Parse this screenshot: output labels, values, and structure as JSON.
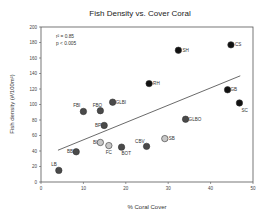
{
  "chart_data": {
    "type": "scatter",
    "title": "Fish Density vs. Cover Coral",
    "xlabel": "% Coral Cover",
    "ylabel": "Fish density (#/100m²)",
    "xlim": [
      0,
      50
    ],
    "ylim": [
      0,
      200
    ],
    "xticks": [
      0,
      10,
      20,
      30,
      40,
      50
    ],
    "yticks": [
      0,
      20,
      40,
      60,
      80,
      100,
      120,
      140,
      160,
      180,
      200
    ],
    "grid": false,
    "legend": null,
    "annotations": [
      "r² = 0.85",
      "p < 0.005"
    ],
    "points": [
      {
        "label": "CS",
        "x": 44.8,
        "y": 177,
        "shade": "black"
      },
      {
        "label": "SH",
        "x": 32.4,
        "y": 170,
        "shade": "black"
      },
      {
        "label": "RH",
        "x": 25.5,
        "y": 127,
        "shade": "black"
      },
      {
        "label": "GB",
        "x": 44.0,
        "y": 119,
        "shade": "black"
      },
      {
        "label": "SC",
        "x": 46.8,
        "y": 102,
        "shade": "black"
      },
      {
        "label": "GLBI",
        "x": 16.9,
        "y": 103,
        "shade": "darkgray"
      },
      {
        "label": "FBO",
        "x": 14.0,
        "y": 92,
        "shade": "darkgray"
      },
      {
        "label": "FBI",
        "x": 10.0,
        "y": 91,
        "shade": "darkgray"
      },
      {
        "label": "GLBO",
        "x": 34.1,
        "y": 81,
        "shade": "darkgray"
      },
      {
        "label": "BP",
        "x": 14.9,
        "y": 73,
        "shade": "darkgray"
      },
      {
        "label": "SB",
        "x": 29.2,
        "y": 56,
        "shade": "lightgray"
      },
      {
        "label": "BI",
        "x": 14.0,
        "y": 51,
        "shade": "lightgray"
      },
      {
        "label": "FC",
        "x": 16.0,
        "y": 47,
        "shade": "lightgray"
      },
      {
        "label": "CBV",
        "x": 24.9,
        "y": 46,
        "shade": "darkgray"
      },
      {
        "label": "BOT",
        "x": 19.0,
        "y": 45,
        "shade": "darkgray"
      },
      {
        "label": "BB",
        "x": 8.3,
        "y": 39,
        "shade": "darkgray"
      },
      {
        "label": "LB",
        "x": 4.2,
        "y": 15,
        "shade": "darkgray"
      }
    ],
    "regression_line": {
      "x0": 4,
      "y0": 41,
      "x1": 47,
      "y1": 137
    }
  },
  "colors": {
    "black": "#111111",
    "darkgray": "#4a4a4a",
    "lightgray": "#c8c8c8",
    "axis": "#555555",
    "line": "#444444"
  }
}
